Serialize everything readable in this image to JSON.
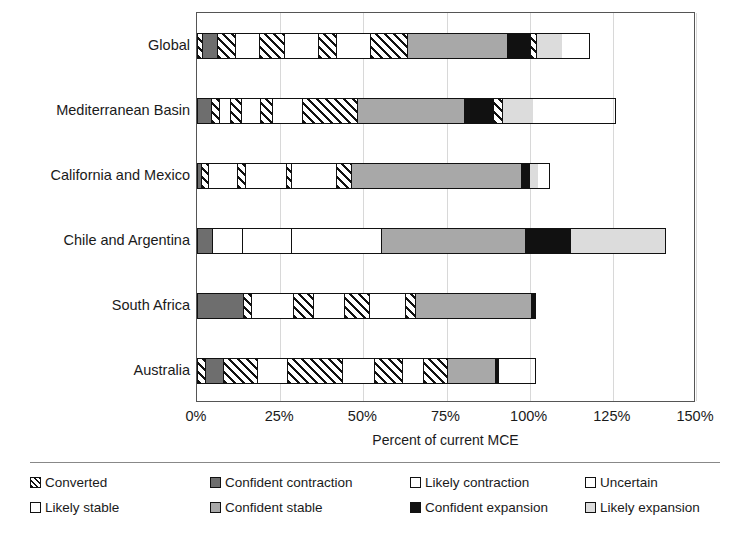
{
  "chart_data": {
    "type": "bar",
    "orientation": "horizontal",
    "stacked": true,
    "title": "",
    "xlabel": "Percent of current MCE",
    "ylabel": "",
    "xlim": [
      0,
      150
    ],
    "xticks": [
      0,
      25,
      50,
      75,
      100,
      125,
      150
    ],
    "xtick_labels": [
      "0%",
      "25%",
      "50%",
      "75%",
      "100%",
      "125%",
      "150%"
    ],
    "grid": true,
    "legend_position": "bottom",
    "categories": [
      "Global",
      "Mediterranean Basin",
      "California and Mexico",
      "Chile and Argentina",
      "South Africa",
      "Australia"
    ],
    "series": [
      {
        "name": "Converted",
        "pattern": "diagonal-hatch",
        "color": "#ffffff",
        "values": [
          1.5,
          1.2,
          1.2,
          0.0,
          0.0,
          2.4
        ]
      },
      {
        "name": "Confident contraction",
        "pattern": "solid",
        "color": "#6e6e6e",
        "values": [
          4.5,
          4.2,
          1.2,
          2.4,
          13.8,
          5.4
        ]
      },
      {
        "name": "Likely contraction",
        "pattern": "diagonal-hatch",
        "color": "#ffffff",
        "values": [
          5.4,
          2.4,
          0.0,
          0.0,
          2.4,
          10.5
        ]
      },
      {
        "name": "Uncertain",
        "pattern": "solid-white",
        "color": "#ffffff",
        "values": [
          7.2,
          6.0,
          9.9,
          9.0,
          12.9,
          9.0
        ]
      },
      {
        "name": "Likely stable",
        "pattern": "diagonal-hatch",
        "color": "#ffffff",
        "values": [
          7.8,
          3.3,
          2.4,
          0.0,
          6.0,
          16.5
        ]
      },
      {
        "name": "Uncertain 2",
        "pattern": "solid-white",
        "color": "#ffffff",
        "values": [
          10.2,
          9.9,
          12.6,
          15.0,
          9.3,
          9.6
        ]
      },
      {
        "name": "Likely stable 2",
        "pattern": "diagonal-hatch",
        "color": "#ffffff",
        "values": [
          5.4,
          3.9,
          1.5,
          0.0,
          7.5,
          8.7
        ]
      },
      {
        "name": "Uncertain 3",
        "pattern": "solid-white",
        "color": "#ffffff",
        "values": [
          10.2,
          9.0,
          13.5,
          17.1,
          11.1,
          6.3
        ]
      },
      {
        "name": "Likely stable 3",
        "pattern": "diagonal-hatch",
        "color": "#ffffff",
        "values": [
          11.4,
          16.5,
          4.5,
          0.0,
          3.0,
          7.2
        ]
      },
      {
        "name": "Confident stable",
        "pattern": "solid",
        "color": "#a8a8a8",
        "values": [
          30.0,
          32.4,
          51.6,
          42.0,
          36.0,
          14.4
        ]
      },
      {
        "name": "Confident expansion",
        "pattern": "solid",
        "color": "#111111",
        "values": [
          6.9,
          8.7,
          2.4,
          12.0,
          0.9,
          0.9
        ]
      },
      {
        "name": "Likely expansion",
        "pattern": "solid-light",
        "color": "#dcdcdc",
        "values": [
          7.5,
          9.0,
          2.4,
          22.5,
          0.0,
          0.0
        ]
      }
    ],
    "totals": [
      108.0,
      106.5,
      103.2,
      120.0,
      102.9,
      90.9
    ],
    "legend_entries": [
      {
        "label": "Converted",
        "pattern": "diagonal-hatch",
        "color": "#ffffff"
      },
      {
        "label": "Confident contraction",
        "pattern": "solid",
        "color": "#6e6e6e"
      },
      {
        "label": "Likely contraction",
        "pattern": "solid-white",
        "color": "#ffffff"
      },
      {
        "label": "Uncertain",
        "pattern": "solid-white",
        "color": "#ffffff"
      },
      {
        "label": "Likely stable",
        "pattern": "solid-white",
        "color": "#ffffff"
      },
      {
        "label": "Confident stable",
        "pattern": "solid",
        "color": "#a8a8a8"
      },
      {
        "label": "Confident expansion",
        "pattern": "solid",
        "color": "#111111"
      },
      {
        "label": "Likely expansion",
        "pattern": "solid-light",
        "color": "#dcdcdc"
      }
    ],
    "bars": [
      {
        "category": "Global",
        "total": 118.0,
        "segments": [
          {
            "series": "Converted",
            "width": 1.5,
            "fill": "converted"
          },
          {
            "series": "Confident contraction",
            "width": 4.5,
            "fill": "confident-contraction"
          },
          {
            "series": "Converted",
            "width": 5.4,
            "fill": "converted"
          },
          {
            "series": "Likely contraction",
            "width": 7.2,
            "fill": "likely-contraction"
          },
          {
            "series": "Converted",
            "width": 7.8,
            "fill": "converted"
          },
          {
            "series": "Uncertain",
            "width": 10.2,
            "fill": "uncertain"
          },
          {
            "series": "Converted",
            "width": 5.4,
            "fill": "converted"
          },
          {
            "series": "Likely stable",
            "width": 10.2,
            "fill": "likely-stable"
          },
          {
            "series": "Converted",
            "width": 11.4,
            "fill": "converted"
          },
          {
            "series": "Confident stable",
            "width": 30.0,
            "fill": "confident-stable"
          },
          {
            "series": "Confident expansion",
            "width": 6.9,
            "fill": "confident-expansion"
          },
          {
            "series": "Converted",
            "width": 2.1,
            "fill": "converted"
          },
          {
            "series": "Likely expansion",
            "width": 7.5,
            "fill": "likely-expansion"
          }
        ]
      },
      {
        "category": "Mediterranean Basin",
        "total": 126.0,
        "segments": [
          {
            "series": "Confident contraction",
            "width": 4.2,
            "fill": "confident-contraction"
          },
          {
            "series": "Converted",
            "width": 2.4,
            "fill": "converted"
          },
          {
            "series": "Likely contraction",
            "width": 3.3,
            "fill": "likely-contraction"
          },
          {
            "series": "Converted",
            "width": 3.3,
            "fill": "converted"
          },
          {
            "series": "Uncertain",
            "width": 5.7,
            "fill": "uncertain"
          },
          {
            "series": "Converted",
            "width": 3.9,
            "fill": "converted"
          },
          {
            "series": "Likely stable",
            "width": 9.0,
            "fill": "likely-stable"
          },
          {
            "series": "Converted",
            "width": 16.5,
            "fill": "converted"
          },
          {
            "series": "Confident stable",
            "width": 32.4,
            "fill": "confident-stable"
          },
          {
            "series": "Confident expansion",
            "width": 8.7,
            "fill": "confident-expansion"
          },
          {
            "series": "Converted",
            "width": 2.7,
            "fill": "converted"
          },
          {
            "series": "Likely expansion",
            "width": 9.0,
            "fill": "likely-expansion"
          }
        ]
      },
      {
        "category": "California and Mexico",
        "total": 106.0,
        "segments": [
          {
            "series": "Confident contraction",
            "width": 1.2,
            "fill": "confident-contraction"
          },
          {
            "series": "Converted",
            "width": 2.1,
            "fill": "converted"
          },
          {
            "series": "Likely contraction",
            "width": 8.7,
            "fill": "likely-contraction"
          },
          {
            "series": "Converted",
            "width": 2.4,
            "fill": "converted"
          },
          {
            "series": "Uncertain",
            "width": 12.6,
            "fill": "uncertain"
          },
          {
            "series": "Converted",
            "width": 1.5,
            "fill": "converted"
          },
          {
            "series": "Likely stable",
            "width": 13.5,
            "fill": "likely-stable"
          },
          {
            "series": "Converted",
            "width": 4.5,
            "fill": "converted"
          },
          {
            "series": "Confident stable",
            "width": 51.6,
            "fill": "confident-stable"
          },
          {
            "series": "Confident expansion",
            "width": 2.4,
            "fill": "confident-expansion"
          },
          {
            "series": "Likely expansion",
            "width": 2.4,
            "fill": "likely-expansion"
          }
        ]
      },
      {
        "category": "Chile and Argentina",
        "total": 141.0,
        "segments": [
          {
            "series": "Confident contraction",
            "width": 4.5,
            "fill": "confident-contraction"
          },
          {
            "series": "Likely contraction",
            "width": 9.0,
            "fill": "likely-contraction"
          },
          {
            "series": "Uncertain",
            "width": 15.0,
            "fill": "uncertain"
          },
          {
            "series": "Likely stable",
            "width": 27.0,
            "fill": "likely-stable"
          },
          {
            "series": "Confident stable",
            "width": 43.5,
            "fill": "confident-stable"
          },
          {
            "series": "Confident expansion",
            "width": 13.5,
            "fill": "confident-expansion"
          },
          {
            "series": "Likely expansion",
            "width": 28.5,
            "fill": "likely-expansion"
          }
        ]
      },
      {
        "category": "South Africa",
        "total": 102.0,
        "segments": [
          {
            "series": "Confident contraction",
            "width": 13.8,
            "fill": "confident-contraction"
          },
          {
            "series": "Converted",
            "width": 2.4,
            "fill": "converted"
          },
          {
            "series": "Likely contraction",
            "width": 12.9,
            "fill": "likely-contraction"
          },
          {
            "series": "Converted",
            "width": 6.0,
            "fill": "converted"
          },
          {
            "series": "Uncertain",
            "width": 9.3,
            "fill": "uncertain"
          },
          {
            "series": "Converted",
            "width": 7.5,
            "fill": "converted"
          },
          {
            "series": "Likely stable",
            "width": 11.1,
            "fill": "likely-stable"
          },
          {
            "series": "Converted",
            "width": 3.0,
            "fill": "converted"
          },
          {
            "series": "Confident stable",
            "width": 35.1,
            "fill": "confident-stable"
          },
          {
            "series": "Confident expansion",
            "width": 0.9,
            "fill": "confident-expansion"
          }
        ]
      },
      {
        "category": "Australia",
        "total": 102.0,
        "segments": [
          {
            "series": "Converted",
            "width": 2.4,
            "fill": "converted"
          },
          {
            "series": "Confident contraction",
            "width": 5.4,
            "fill": "confident-contraction"
          },
          {
            "series": "Converted",
            "width": 10.5,
            "fill": "converted"
          },
          {
            "series": "Likely contraction",
            "width": 9.0,
            "fill": "likely-contraction"
          },
          {
            "series": "Converted",
            "width": 16.5,
            "fill": "converted"
          },
          {
            "series": "Uncertain",
            "width": 9.6,
            "fill": "uncertain"
          },
          {
            "series": "Converted",
            "width": 8.7,
            "fill": "converted"
          },
          {
            "series": "Likely stable",
            "width": 6.3,
            "fill": "likely-stable"
          },
          {
            "series": "Converted",
            "width": 7.2,
            "fill": "converted"
          },
          {
            "series": "Confident stable",
            "width": 14.4,
            "fill": "confident-stable"
          },
          {
            "series": "Confident expansion",
            "width": 0.9,
            "fill": "confident-expansion"
          }
        ]
      }
    ]
  }
}
